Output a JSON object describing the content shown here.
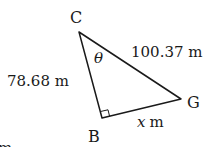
{
  "diagram": {
    "vertices": {
      "C": {
        "label": "C"
      },
      "B": {
        "label": "B"
      },
      "G": {
        "label": "G"
      }
    },
    "sides": {
      "CB": "78.68 m",
      "CG": "100.37 m",
      "BG_var": "x",
      "BG_unit": "m"
    },
    "angle_label": "θ",
    "cut_text": "m"
  }
}
